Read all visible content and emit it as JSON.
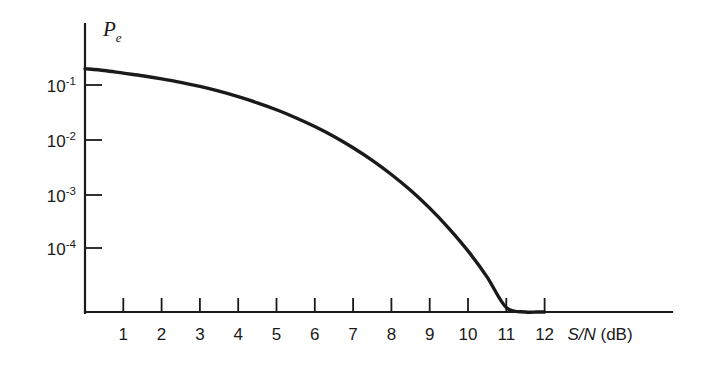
{
  "chart_data": {
    "type": "line",
    "title": "",
    "subtitle": "",
    "xlabel": "S/N (dB)",
    "ylabel": "Pe",
    "ylabel_base": "P",
    "ylabel_sub": "e",
    "yscale": "log",
    "xscale": "linear",
    "grid": false,
    "legend": null,
    "xlim": [
      0,
      13.8
    ],
    "ylim": [
      1e-05,
      0.35
    ],
    "xticks": [
      1,
      2,
      3,
      4,
      5,
      6,
      7,
      8,
      9,
      10,
      11,
      12
    ],
    "xticklabels": [
      "1",
      "2",
      "3",
      "4",
      "5",
      "6",
      "7",
      "8",
      "9",
      "10",
      "11",
      "12"
    ],
    "yticks": [
      0.1,
      0.01,
      0.001,
      0.0001
    ],
    "yticklabels": [
      "10-1",
      "10-2",
      "10-3",
      "10-4"
    ],
    "ytick_mantissa": [
      "10",
      "10",
      "10",
      "10"
    ],
    "ytick_exponent": [
      "-1",
      "-2",
      "-3",
      "-4"
    ],
    "series": [
      {
        "name": "Probability of error",
        "color": "#1a1a1a",
        "x": [
          0.0,
          0.5,
          1.0,
          1.5,
          2.0,
          2.5,
          3.0,
          3.5,
          4.0,
          4.5,
          5.0,
          5.5,
          6.0,
          6.5,
          7.0,
          7.5,
          8.0,
          8.5,
          9.0,
          9.5,
          10.0,
          10.5,
          11.0,
          11.5,
          11.8,
          12.0
        ],
        "y": [
          0.2,
          0.185,
          0.165,
          0.148,
          0.13,
          0.112,
          0.094,
          0.077,
          0.061,
          0.047,
          0.035,
          0.025,
          0.0172,
          0.0113,
          0.007,
          0.0041,
          0.00225,
          0.00115,
          0.00054,
          0.00023,
          8.8e-05,
          2.9e-05,
          8e-06,
          1.8e-06,
          9e-07,
          5.5e-07
        ]
      }
    ],
    "annotations": [
      {
        "name": "curve-endpoint",
        "x": 12,
        "note": "curve meets x-axis baseline at S/N = 12 dB"
      }
    ]
  },
  "axes": {
    "x_axis_name": "signal-to-noise-ratio-axis",
    "y_axis_name": "probability-of-error-axis"
  }
}
